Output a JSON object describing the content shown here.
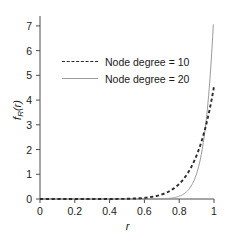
{
  "chart_data": {
    "type": "line",
    "title": "",
    "xlabel": "r",
    "ylabel": "f_R(r)",
    "ylabel_base": "f",
    "ylabel_sub": "R",
    "ylabel_arg": "(r)",
    "xlim": [
      0,
      1
    ],
    "ylim": [
      0,
      7.4
    ],
    "xticks": [
      0,
      0.2,
      0.4,
      0.6,
      0.8,
      1
    ],
    "xticklabels": [
      "0",
      "0.2",
      "0.4",
      "0.6",
      "0.8",
      "1"
    ],
    "yticks": [
      0,
      1,
      2,
      3,
      4,
      5,
      6,
      7
    ],
    "yticklabels": [
      "0",
      "1",
      "2",
      "3",
      "4",
      "5",
      "6",
      "7"
    ],
    "grid": false,
    "legend_position": "upper-left-inside",
    "series": [
      {
        "name": "Node degree = 10",
        "style": "dashed",
        "color": "#2b2b2b",
        "exponent": 10,
        "scale": 4.55,
        "x": [
          0,
          0.05,
          0.1,
          0.15,
          0.2,
          0.25,
          0.3,
          0.35,
          0.4,
          0.45,
          0.5,
          0.55,
          0.6,
          0.65,
          0.7,
          0.75,
          0.8,
          0.85,
          0.9,
          0.95,
          1
        ],
        "values": [
          0,
          0.0,
          0.0,
          0.0,
          0.001,
          0.004,
          0.012,
          0.03,
          0.067,
          0.136,
          0.254,
          0.447,
          0.748,
          1.203,
          1.867,
          2.81,
          4.118,
          5.899,
          8.283,
          11.425,
          15.5
        ]
      },
      {
        "name": "Node degree = 20",
        "style": "solid",
        "color": "#9a9a9a",
        "exponent": 20,
        "scale": 7.6,
        "x": [
          0,
          0.05,
          0.1,
          0.15,
          0.2,
          0.25,
          0.3,
          0.35,
          0.4,
          0.45,
          0.5,
          0.55,
          0.6,
          0.65,
          0.7,
          0.75,
          0.8,
          0.85,
          0.9,
          0.95,
          1
        ],
        "values": [
          0,
          0.0,
          0.0,
          0.0,
          0.0,
          0.0,
          0.0,
          0.0,
          0.001,
          0.004,
          0.014,
          0.045,
          0.13,
          0.346,
          0.861,
          2.018,
          4.47,
          9.38,
          18.7,
          35.4,
          64.0
        ]
      }
    ],
    "annotations": []
  },
  "legend": {
    "entries": [
      {
        "label": "Node degree = 10",
        "style": "dashed"
      },
      {
        "label": "Node degree = 20",
        "style": "solid"
      }
    ]
  },
  "axes": {
    "x_title": "r",
    "y_title_base": "f",
    "y_title_sub": "R",
    "y_title_arg": "(r)"
  },
  "colors": {
    "dashed_series": "#2b2b2b",
    "solid_series": "#9a9a9a",
    "axis": "#4d4d4d",
    "text": "#1a1a1a",
    "background": "#ffffff"
  }
}
